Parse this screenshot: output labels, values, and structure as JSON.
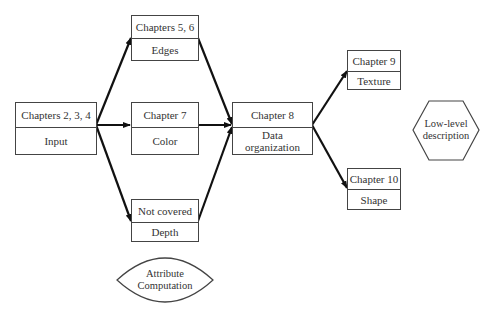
{
  "diagram": {
    "nodes": [
      {
        "id": "input",
        "chapter": "Chapters 2, 3, 4",
        "label": "Input"
      },
      {
        "id": "edges",
        "chapter": "Chapters 5, 6",
        "label": "Edges"
      },
      {
        "id": "color",
        "chapter": "Chapter 7",
        "label": "Color"
      },
      {
        "id": "depth",
        "chapter": "Not covered",
        "label": "Depth"
      },
      {
        "id": "data-organization",
        "chapter": "Chapter 8",
        "label": "Data organization"
      },
      {
        "id": "texture",
        "chapter": "Chapter 9",
        "label": "Texture"
      },
      {
        "id": "shape",
        "chapter": "Chapter 10",
        "label": "Shape"
      }
    ],
    "edges": [
      {
        "from": "input",
        "to": "edges"
      },
      {
        "from": "input",
        "to": "color"
      },
      {
        "from": "input",
        "to": "depth"
      },
      {
        "from": "edges",
        "to": "data-organization"
      },
      {
        "from": "color",
        "to": "data-organization"
      },
      {
        "from": "depth",
        "to": "data-organization"
      },
      {
        "from": "data-organization",
        "to": "texture"
      },
      {
        "from": "data-organization",
        "to": "shape"
      }
    ],
    "legend": {
      "attribute": "Attribute Computation",
      "attribute_line1": "Attribute",
      "attribute_line2": "Computation",
      "lowlevel": "Low-level description",
      "lowlevel_line1": "Low-level",
      "lowlevel_line2": "description"
    },
    "colors": {
      "line": "#111111",
      "border": "#444444",
      "text": "#333333"
    }
  }
}
